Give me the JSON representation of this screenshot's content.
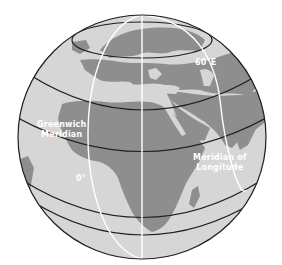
{
  "diagram": {
    "type": "globe-longitude",
    "colors": {
      "ocean": "#d6d6d6",
      "land": "#8e8e8e",
      "latitude_lines": "#1e1e1e",
      "meridian_lines": "#ffffff",
      "background": "#ffffff"
    },
    "labels": {
      "greenwich_line1": "Greenwich",
      "greenwich_line2": "Meridian",
      "zero_degree": "0°",
      "sixty_east": "60°E",
      "meridian_line1": "Meridian of",
      "meridian_line2": "Longitude"
    }
  }
}
